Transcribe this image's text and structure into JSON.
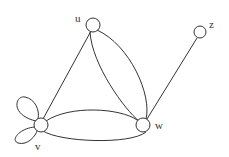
{
  "diagram": {
    "type": "multigraph",
    "nodes": [
      {
        "id": "u",
        "label": "u"
      },
      {
        "id": "v",
        "label": "v"
      },
      {
        "id": "w",
        "label": "w"
      },
      {
        "id": "z",
        "label": "z"
      }
    ],
    "edges": [
      {
        "from": "u",
        "to": "v",
        "kind": "straight"
      },
      {
        "from": "u",
        "to": "w",
        "kind": "curved-1"
      },
      {
        "from": "u",
        "to": "w",
        "kind": "curved-2"
      },
      {
        "from": "v",
        "to": "w",
        "kind": "curved-upper"
      },
      {
        "from": "v",
        "to": "w",
        "kind": "curved-lower"
      },
      {
        "from": "w",
        "to": "z",
        "kind": "straight"
      },
      {
        "from": "v",
        "to": "v",
        "kind": "loop-upper"
      },
      {
        "from": "v",
        "to": "v",
        "kind": "loop-lower"
      }
    ],
    "colors": {
      "stroke": "#333333",
      "background": "#ffffff"
    }
  }
}
